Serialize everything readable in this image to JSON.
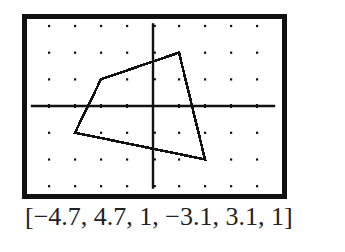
{
  "chart_data": {
    "type": "line",
    "title": "",
    "xlabel": "",
    "ylabel": "",
    "window": {
      "xmin": -4.7,
      "xmax": 4.7,
      "xscl": 1,
      "ymin": -3.1,
      "ymax": 3.1,
      "yscl": 1
    },
    "xlim": [
      -4.7,
      4.7
    ],
    "ylim": [
      -3.1,
      3.1
    ],
    "grid": "dots",
    "axes": true,
    "series": [
      {
        "name": "quadrilateral",
        "closed": true,
        "points": [
          {
            "x": 1,
            "y": 2
          },
          {
            "x": -2,
            "y": 1
          },
          {
            "x": -3,
            "y": -1
          },
          {
            "x": 2,
            "y": -2
          }
        ]
      }
    ],
    "caption": "[−4.7, 4.7, 1, −3.1, 3.1, 1]"
  },
  "caption": {
    "text": "[−4.7, 4.7, 1, −3.1, 3.1, 1]"
  },
  "colors": {
    "ink": "#111111",
    "background": "#ffffff"
  }
}
